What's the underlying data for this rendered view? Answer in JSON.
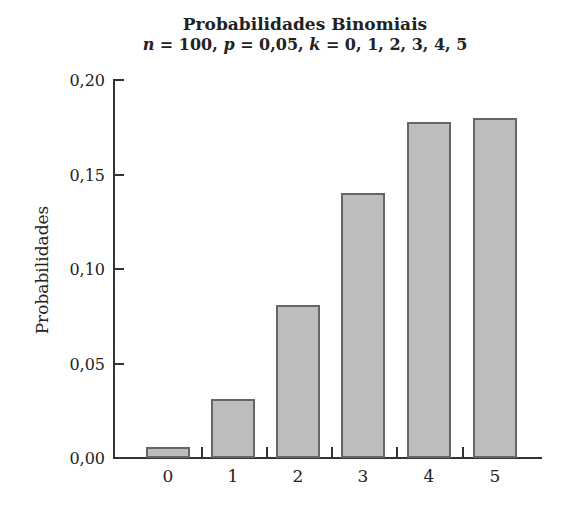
{
  "chart_data": {
    "type": "bar",
    "title": "Probabilidades Binomiais",
    "subtitle": "n = 100, p = 0,05, k = 0, 1, 2, 3, 4, 5",
    "subtitle_parts": {
      "n": "n",
      "n_val": " = 100, ",
      "p": "p",
      "p_val": " = 0,05, ",
      "k": "k",
      "k_val": " = 0, 1, 2, 3, 4, 5"
    },
    "xlabel": "",
    "ylabel": "Probabilidades",
    "categories": [
      "0",
      "1",
      "2",
      "3",
      "4",
      "5"
    ],
    "values": [
      0.006,
      0.031,
      0.081,
      0.14,
      0.178,
      0.18
    ],
    "ylim": [
      0,
      0.2
    ],
    "yticks": [
      "0,00",
      "0,05",
      "0,10",
      "0,15",
      "0,20"
    ],
    "grid": false,
    "bar_color": "#bdbdbd",
    "bar_edge_color": "#666666"
  }
}
